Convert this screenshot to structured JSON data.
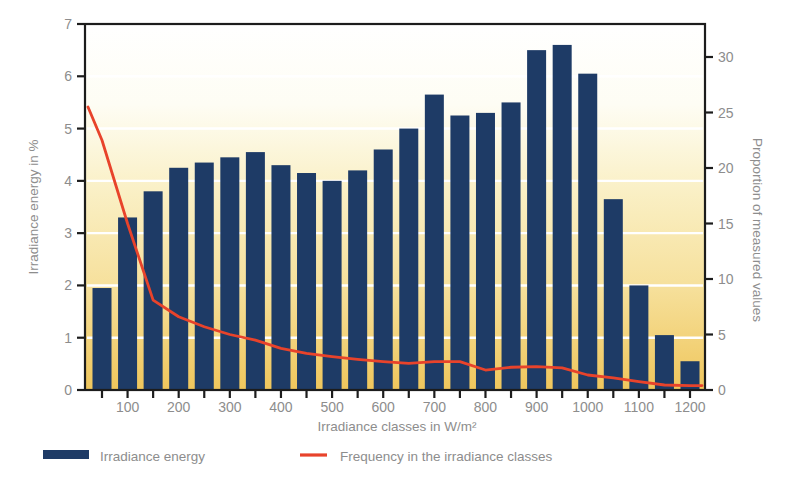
{
  "figure": {
    "background_color": "#ffffff",
    "plot_gradient_top": "#ffffff",
    "plot_gradient_mid": "#f9efc4",
    "plot_gradient_bottom": "#efc65c",
    "frame_color": "#1c1c1c",
    "gridline_color": "#ffffff",
    "text_color": "#8d8d8d"
  },
  "legend": {
    "items": [
      {
        "label": "Irradiance energy",
        "marker": "bar-swatch",
        "color": "#1e3b66"
      },
      {
        "label": "Frequency in the irradiance classes",
        "marker": "line-swatch",
        "color": "#e8432b"
      }
    ]
  },
  "chart_data": {
    "type": "bar",
    "title": "",
    "xlabel": "Irradiance classes in W/m²",
    "ylabel": "Irradiance energy in %",
    "ylabel_right": "Proportion of measured values",
    "grid": "horizontal white gridlines at left-axis integer values",
    "legend_position": "bottom",
    "categories": [
      50,
      100,
      150,
      200,
      250,
      300,
      350,
      400,
      450,
      500,
      550,
      600,
      650,
      700,
      750,
      800,
      850,
      900,
      950,
      1000,
      1050,
      1100,
      1150,
      1200
    ],
    "x_tick_step": 50,
    "x_label_ticks": [
      100,
      200,
      300,
      400,
      500,
      600,
      700,
      800,
      900,
      1000,
      1100,
      1200
    ],
    "left_axis": {
      "label": "Irradiance energy in %",
      "min": 0,
      "max": 7,
      "ticks": [
        0,
        1,
        2,
        3,
        4,
        5,
        6,
        7
      ]
    },
    "right_axis": {
      "label": "Proportion of measured values",
      "min": 0,
      "max": 33,
      "ticks": [
        0,
        5,
        10,
        15,
        20,
        25,
        30
      ]
    },
    "gridline_values_left": [
      1,
      2,
      3,
      4,
      5,
      6
    ],
    "series": [
      {
        "name": "Irradiance energy",
        "type": "bar",
        "axis": "left",
        "color": "#1e3b66",
        "values": [
          1.95,
          3.3,
          3.8,
          4.25,
          4.35,
          4.45,
          4.55,
          4.3,
          4.15,
          4.0,
          4.2,
          4.6,
          5.0,
          5.65,
          5.25,
          5.3,
          5.5,
          6.5,
          6.6,
          6.05,
          3.65,
          2.0,
          1.05,
          0.55
        ]
      },
      {
        "name": "Frequency in the irradiance classes",
        "type": "line",
        "axis": "right",
        "color": "#e8432b",
        "edge_start_value": 25.5,
        "edge_end_value": 0.4,
        "values": [
          22.5,
          15.0,
          8.1,
          6.6,
          5.7,
          5.0,
          4.5,
          3.75,
          3.3,
          3.0,
          2.75,
          2.55,
          2.4,
          2.55,
          2.55,
          1.8,
          2.05,
          2.1,
          2.0,
          1.35,
          1.1,
          0.75,
          0.45,
          0.4
        ]
      }
    ]
  }
}
